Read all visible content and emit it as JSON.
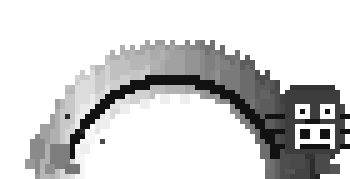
{
  "artwork": {
    "title": "Arched Pixel Cat Creature",
    "subject": "cat-arch-creature",
    "style": "low-resolution pixelated grayscale raster",
    "background_color": "#ffffff",
    "canvas": {
      "width": 350,
      "height": 179,
      "pixel_size": 5,
      "grid_cols": 70,
      "grid_rows": 36
    },
    "palette": {
      "background": "#ffffff",
      "outline_black": "#121212",
      "near_black": "#2b2b2b",
      "dark_gray": "#4a4a4a",
      "mid_dark_gray": "#626262",
      "mid_gray": "#7d7d7d",
      "gray": "#969696",
      "light_mid_gray": "#ababab",
      "light_gray": "#c2c2c2",
      "pale_gray": "#d8d8d8",
      "near_white": "#eeeeee",
      "white": "#ffffff"
    },
    "features": [
      {
        "name": "arch-body",
        "description": "broad rainbow-shaped arched body spanning left to right"
      },
      {
        "name": "back-stripe",
        "description": "black stepped stripe running along the inner curve of the arch"
      },
      {
        "name": "white-spots",
        "description": "row of white blocky spots beneath the black stripe"
      },
      {
        "name": "fur-edge",
        "description": "jagged stepped outer edge along the top of the arch"
      },
      {
        "name": "cat-face",
        "description": "face at the right end with two eyes, nose, mouth and whiskers"
      },
      {
        "name": "left-legs",
        "description": "two stubby legs at the left end of the arch"
      },
      {
        "name": "right-legs",
        "description": "two stubby legs beneath the face at the right end"
      }
    ],
    "face": {
      "eyes": 2,
      "eye_color": "#ffffff",
      "pupil_color": "#121212",
      "muzzle_color": "#ffffff",
      "mouth_color": "#121212",
      "whiskers_per_side": 3,
      "whisker_color": "#121212",
      "head_color": "#3d3d3d"
    },
    "gradient_bands": {
      "description": "body shades run from medium gray at far left, brightening to pale near the left-center, then darkening progressively toward the right end",
      "left_to_right_values": [
        "#9a9a9a",
        "#b0b0b0",
        "#c8c8c8",
        "#dcdcdc",
        "#d2d2d2",
        "#c0c0c0",
        "#b6b6b6",
        "#aaaaaa",
        "#a0a0a0",
        "#949494",
        "#888888",
        "#7a7a7a",
        "#6b6b6b",
        "#5c5c5c",
        "#4e4e4e",
        "#434343",
        "#3a3a3a"
      ]
    }
  }
}
